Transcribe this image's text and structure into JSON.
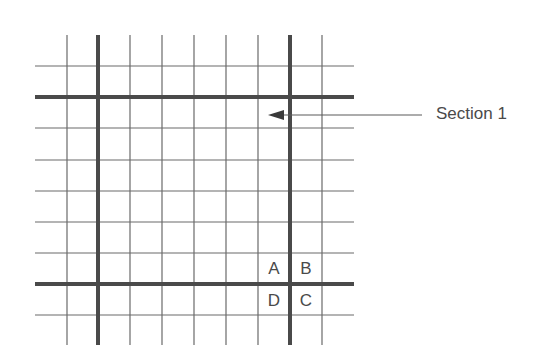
{
  "diagram": {
    "type": "grid",
    "grid": {
      "left": 35,
      "right": 354,
      "top": 35,
      "bottom": 345,
      "thin_vertical_x": [
        67,
        130,
        162,
        194,
        226,
        258,
        322
      ],
      "thick_vertical_x": [
        98,
        290
      ],
      "thin_horizontal_y": [
        66,
        128,
        160,
        191,
        222,
        253,
        315
      ],
      "thick_horizontal_y": [
        97,
        284
      ],
      "thin_color": "#6a6a6a",
      "thick_color": "#4a4a4a"
    },
    "callout": {
      "label": "Section 1",
      "arrow_tip": [
        268,
        115
      ],
      "line_end_x": 422
    },
    "cells": [
      {
        "label": "A",
        "x": 258,
        "y": 253
      },
      {
        "label": "B",
        "x": 290,
        "y": 253
      },
      {
        "label": "D",
        "x": 258,
        "y": 285
      },
      {
        "label": "C",
        "x": 290,
        "y": 285
      }
    ]
  }
}
